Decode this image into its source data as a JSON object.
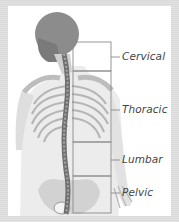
{
  "diagram": {
    "regions": [
      {
        "label": "Cervical"
      },
      {
        "label": "Thoracic"
      },
      {
        "label": "Lumbar"
      },
      {
        "label": "Pelvic"
      }
    ]
  },
  "colors": {
    "frame": "#d9d9d9",
    "panel": "#ffffff",
    "bone": "#9a9a9a",
    "skull": "#8c8c8c",
    "bracket": "#8a8a8a",
    "label": "#444444"
  }
}
